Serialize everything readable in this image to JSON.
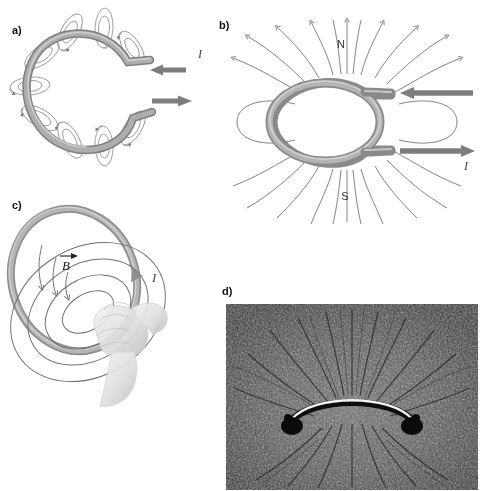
{
  "figure": {
    "background_color": "#ffffff",
    "wire_color": "#8a8a8a",
    "wire_highlight_color": "#c9c9c9",
    "field_line_color": "#6e6e6e",
    "arrow_color": "#7d7d7d",
    "text_color": "#111111"
  },
  "panels": [
    {
      "id": "a",
      "label": "a)",
      "description": "Current loop with concentric magnetic field rings around the wire",
      "current_label": "I",
      "current_in_arrow": "left-arrow",
      "current_out_arrow": "right-arrow",
      "field_ring_count": 8
    },
    {
      "id": "b",
      "label": "b)",
      "description": "Cross-sectional magnetic field lines of the loop, with north and south poles marked",
      "pole_north": "N",
      "pole_south": "S",
      "current_label": "I",
      "current_in_arrow": "left-arrow",
      "current_out_arrow": "right-arrow"
    },
    {
      "id": "c",
      "label": "c)",
      "description": "Right-hand grip rule applied to a current loop",
      "field_label": "B",
      "field_label_has_vector_arrow": true,
      "current_label": "I"
    },
    {
      "id": "d",
      "label": "d)",
      "description": "Photograph of iron filings revealing the magnetic field of a current loop",
      "photo_caption": "",
      "is_photograph": true
    }
  ]
}
